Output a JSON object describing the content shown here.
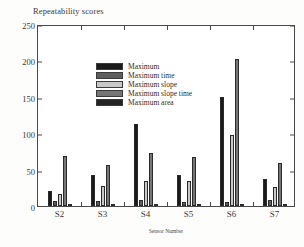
{
  "chart_data": {
    "type": "bar",
    "title": "Repeatability scores",
    "xlabel": "Sensor Number",
    "ylabel": "",
    "categories": [
      "S2",
      "S3",
      "S4",
      "S5",
      "S6",
      "S7"
    ],
    "ylim": [
      0,
      250
    ],
    "yticks": [
      0,
      50,
      100,
      150,
      200,
      250
    ],
    "grid": false,
    "legend_position": "upper-left-inside",
    "series": [
      {
        "name": "Maximum",
        "color": "#1a1a1a",
        "values": [
          20,
          42,
          112,
          43,
          150,
          37
        ]
      },
      {
        "name": "Maximum time",
        "color": "#5e5e5e",
        "values": [
          7,
          7,
          8,
          6,
          6,
          8
        ]
      },
      {
        "name": "Maximum slope",
        "color": "#c8c8c8",
        "values": [
          16,
          27,
          35,
          34,
          98,
          26
        ]
      },
      {
        "name": "Maximum slope time",
        "color": "#767676",
        "values": [
          69,
          56,
          73,
          68,
          202,
          59
        ]
      },
      {
        "name": "Maximum area",
        "color": "#232323",
        "values": [
          2,
          2,
          2,
          2,
          2,
          3
        ]
      }
    ]
  }
}
